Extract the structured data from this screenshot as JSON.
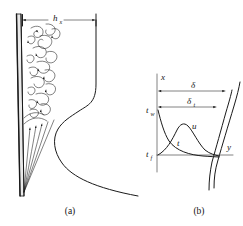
{
  "figure": {
    "name": "natural-convection-vertical-plate",
    "background_color": "#ffffff",
    "ink_color": "#1a1a1a",
    "plate_fill_color": "#e9e9e9",
    "width": 243,
    "height": 226
  },
  "panels": [
    {
      "id": "a",
      "caption": "(a)",
      "caption_x": 70,
      "caption_y": 214,
      "description": "Vertical heated plate with laminar streamlines, turbulent eddies and local heat transfer coefficient profile",
      "dimension": {
        "name": "h-sub-x",
        "symbol": "h",
        "subscript": "x",
        "symbol_x": 53,
        "symbol_y": 21,
        "subscript_x": 59.5,
        "subscript_y": 23.5,
        "line_y": 20,
        "line_x1": 22,
        "line_x2": 96
      },
      "plate": {
        "name": "vertical-plate",
        "top_x": 17,
        "top_y": 14,
        "bottom_x": 20,
        "bottom_y": 196,
        "thickness_top": 4.5,
        "thickness_bottom": 3.5
      },
      "regions": [
        {
          "name": "turbulent-region",
          "label": "",
          "y_from": 20,
          "y_to": 112
        },
        {
          "name": "laminar-region",
          "label": "",
          "y_from": 112,
          "y_to": 196
        }
      ],
      "h_curve": {
        "name": "heat-transfer-coefficient-curve",
        "path": "M 96,20 L 96,84 C 96,103 88,105 79,111 C 70,117 63,121 58,129 C 52,139 54,152 62,163 C 72,177 95,188 138,196"
      }
    },
    {
      "id": "b",
      "caption": "(b)",
      "caption_x": 199,
      "caption_y": 214,
      "description": "Boundary layer coordinate system with velocity and temperature profiles",
      "axes": {
        "vertical": {
          "name": "x-axis",
          "label": "x",
          "label_x": 161,
          "label_y": 80,
          "x": 157,
          "y_top": 74,
          "y_bottom": 172
        },
        "horizontal": {
          "name": "y-axis",
          "label": "y",
          "label_x": 227,
          "label_y": 150,
          "y": 155,
          "x_left": 157,
          "x_right": 233
        }
      },
      "wall_temperature": {
        "name": "wall-temperature-label",
        "symbol": "t",
        "subscript": "w",
        "symbol_x": 146,
        "symbol_y": 113,
        "subscript_x": 151,
        "subscript_y": 115.5
      },
      "fluid_temperature": {
        "name": "fluid-temperature-label",
        "symbol": "t",
        "subscript": "f",
        "symbol_x": 146,
        "symbol_y": 157,
        "subscript_x": 151,
        "subscript_y": 159.5
      },
      "velocity_profile": {
        "name": "velocity-profile",
        "label": "u",
        "label_x": 192,
        "label_y": 129,
        "path": "M 158,155 C 167,150 172,140 177,130 C 180,124 184,122 188,126 C 193,131 198,143 205,150 C 210,154 215,155 219,156"
      },
      "temperature_profile": {
        "name": "temperature-profile",
        "label": "t",
        "label_x": 177,
        "label_y": 146,
        "path": "M 158,110 C 161,122 164,133 169,141 C 176,151 190,155 203,156 C 210,156.5 215,156.8 219,157"
      },
      "boundary_layers": [
        {
          "name": "velocity-boundary-layer-edge",
          "symbol": "delta",
          "glyph": "δ",
          "subscript": "",
          "symbol_x": 193,
          "symbol_y": 88,
          "arrow_y": 91,
          "arrow_x1": 158,
          "arrow_x2": 226,
          "curve_path": "M 214,188 C 214,178 215,170 218,160 C 222,146 228,126 234,106 C 237,96 239,88 240,82"
        },
        {
          "name": "thermal-boundary-layer-edge",
          "symbol": "delta_t",
          "glyph": "δ",
          "subscript": "t",
          "symbol_x": 189,
          "symbol_y": 104,
          "subscript_x": 195,
          "subscript_y": 106.5,
          "arrow_y": 107,
          "arrow_x1": 158,
          "arrow_x2": 217,
          "curve_path": "M 209,190 C 209,180 210,172 212,162 C 216,148 221,130 226,112 C 229,102 231,95 232,90"
        }
      ]
    }
  ]
}
